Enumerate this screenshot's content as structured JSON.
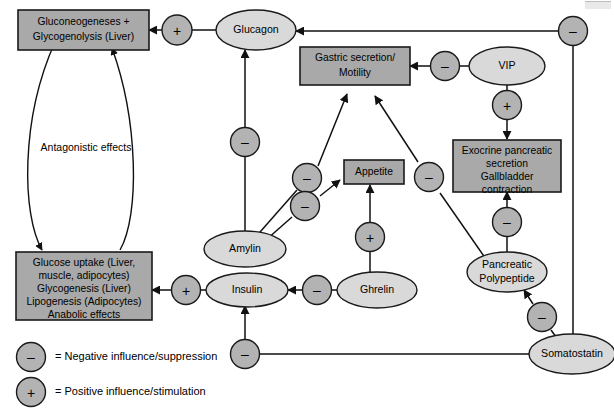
{
  "diagram": {
    "colors": {
      "box_fill": "#a9a9a9",
      "ellipse_fill": "#d9d9d9",
      "circle_fill": "#b3b3b3",
      "stroke": "#111111",
      "background": "#ffffff"
    },
    "nodes": {
      "gluconeogenesis_box": {
        "line1": "Gluconeogeneses +",
        "line2": "Glycogenolysis (Liver)"
      },
      "glucose_uptake_box": {
        "line1": "Glucose uptake (Liver,",
        "line2": "muscle, adipocytes)",
        "line3": "Glycogenesis (Liver)",
        "line4": "Lipogenesis (Adipocytes)",
        "line5": "Anabolic effects"
      },
      "gastric_box": {
        "line1": "Gastric secretion/",
        "line2": "Motility"
      },
      "exocrine_box": {
        "line1": "Exocrine pancreatic",
        "line2": "secretion",
        "line3": "Gallbladder",
        "line4": "contraction"
      },
      "appetite_box": {
        "line1": "Appetite"
      },
      "glucagon": {
        "label": "Glucagon"
      },
      "vip": {
        "label": "VIP"
      },
      "amylin": {
        "label": "Amylin"
      },
      "insulin": {
        "label": "Insulin"
      },
      "ghrelin": {
        "label": "Ghrelin"
      },
      "pancreatic_polypeptide": {
        "line1": "Pancreatic",
        "line2": "Polypeptide"
      },
      "somatostatin": {
        "label": "Somatostatin"
      }
    },
    "annotations": {
      "antagonistic": "Antagonistic effects"
    },
    "signs": {
      "negative": "–",
      "positive": "+"
    },
    "edge_signs": {
      "glucagon_to_gluconeogenesis": "+",
      "somatostatin_to_glucagon": "–",
      "amylin_to_glucagon": "–",
      "amylin_to_gastric": "–",
      "amylin_to_appetite": "–",
      "vip_to_gastric": "–",
      "vip_to_exocrine": "+",
      "pp_to_gastric": "–",
      "pp_to_exocrine": "–",
      "somatostatin_to_pp": "–",
      "somatostatin_to_insulin": "–",
      "ghrelin_to_insulin": "–",
      "ghrelin_to_appetite": "+",
      "insulin_to_glucose_uptake": "+"
    },
    "legend": [
      {
        "sign": "–",
        "text": "= Negative influence/suppression"
      },
      {
        "sign": "+",
        "text": "= Positive influence/stimulation"
      }
    ]
  }
}
